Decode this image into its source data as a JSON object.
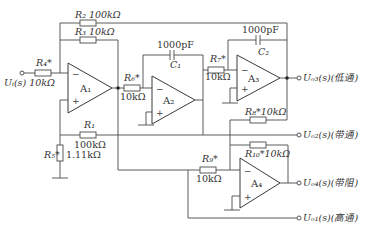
{
  "diagram": {
    "type": "state-variable active filter circuit",
    "input": {
      "label": "U_i(s)",
      "display": "Uᵢ(s)"
    },
    "opamps": [
      {
        "id": "A1",
        "display": "A₁"
      },
      {
        "id": "A2",
        "display": "A₂"
      },
      {
        "id": "A3",
        "display": "A₃"
      },
      {
        "id": "A4",
        "display": "A₄"
      }
    ],
    "resistors": {
      "R1": {
        "name": "R₁",
        "value": "100kΩ"
      },
      "R2": {
        "name": "R₂",
        "value": "100kΩ"
      },
      "R3": {
        "name": "R₃",
        "value": "10kΩ"
      },
      "R4": {
        "name": "R₄*",
        "value": "10kΩ"
      },
      "R5": {
        "name": "R₅*",
        "value": "1.11kΩ"
      },
      "R6": {
        "name": "R₆*",
        "value": "10kΩ"
      },
      "R7": {
        "name": "R₇*",
        "value": "10kΩ"
      },
      "R8": {
        "name": "R₈*",
        "value": "10kΩ"
      },
      "R9": {
        "name": "R₉*",
        "value": "10kΩ"
      },
      "R10": {
        "name": "R₁₀*",
        "value": "10kΩ"
      }
    },
    "capacitors": {
      "C1": {
        "name": "C₁",
        "value": "1000pF"
      },
      "C2": {
        "name": "C₂",
        "value": "1000pF"
      }
    },
    "outputs": [
      {
        "id": "Uo3",
        "label": "Uₒ₃(s)",
        "desc": "(低通)"
      },
      {
        "id": "Uo2",
        "label": "Uₒ₂(s)",
        "desc": "(带通)"
      },
      {
        "id": "Uo4",
        "label": "Uₒ₄(s)",
        "desc": "(带阻)"
      },
      {
        "id": "Uo1",
        "label": "Uₒ₁(s)",
        "desc": "(高通)"
      }
    ],
    "labels": {
      "R2": "R₂ 100kΩ",
      "R3": "R₃ 10kΩ",
      "R4_name": "R₄*",
      "R4_val": "Uᵢ(s) 10kΩ",
      "R1_name": "R₁",
      "R1_val": "100kΩ",
      "R5_name": "R₅*",
      "R5_val": "1.11kΩ",
      "R6_name": "R₆*",
      "R6_val": "10kΩ",
      "R7_name": "R₇*",
      "R7_val": "10kΩ",
      "R8": "R₈*10kΩ",
      "R9_name": "R₉*",
      "R9_val": "10kΩ",
      "R10": "R₁₀*10kΩ",
      "C1_name": "C₁",
      "C1_val": "1000pF",
      "C2_name": "C₂",
      "C2_val": "1000pF",
      "out3": "Uₒ₃(s)(低通)",
      "out2": "Uₒ₂(s)(带通)",
      "out4": "Uₒ₄(s)(带阻)",
      "out1": "Uₒ₁(s)(高通)",
      "minus": "−",
      "plus": "+"
    }
  }
}
